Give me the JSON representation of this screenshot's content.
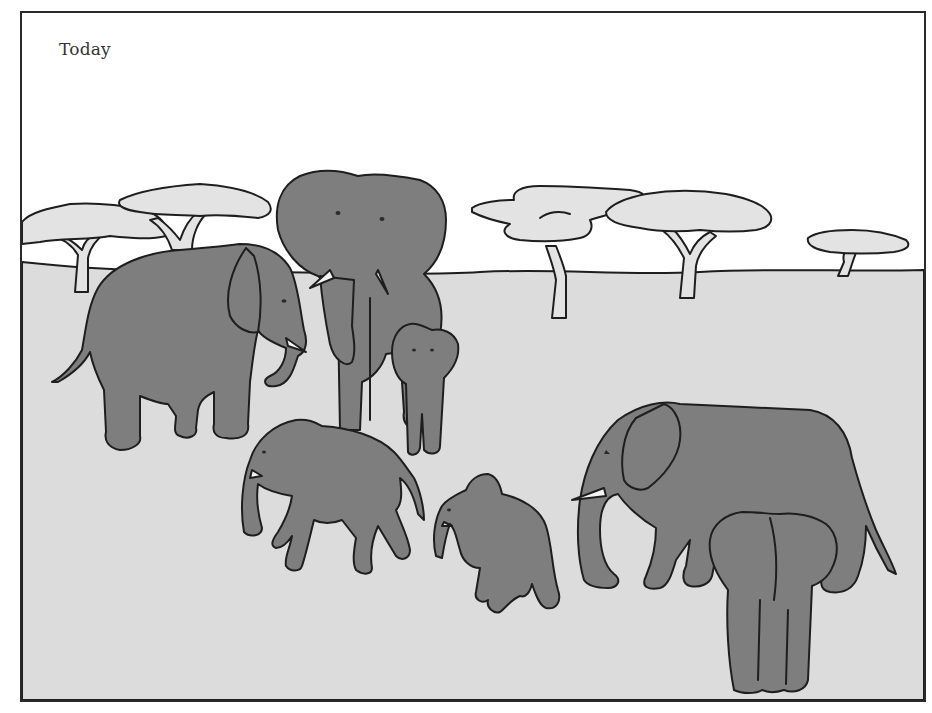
{
  "illustration": {
    "caption": "Today",
    "description": "Line illustration of an African savanna with a herd of elephants in the foreground and flat-topped acacia trees along the horizon",
    "colors": {
      "sky": "#ffffff",
      "ground": "#dcdcdc",
      "elephant_fill": "#7e7e7e",
      "foliage": "#e3e3e3",
      "tusk": "#f4f4f4",
      "outline": "#1e1e1e",
      "frame": "#2a2a2a"
    },
    "trees": [
      {
        "id": "tree-left-1",
        "position": "far left"
      },
      {
        "id": "tree-left-2",
        "position": "left, behind central bull"
      },
      {
        "id": "tree-center-1",
        "position": "center"
      },
      {
        "id": "tree-center-2",
        "position": "center right"
      },
      {
        "id": "tree-right",
        "position": "far right, distant"
      }
    ],
    "elephants": [
      {
        "id": "adult-left",
        "description": "adult facing right with tusks"
      },
      {
        "id": "bull-center",
        "description": "large adult facing viewer with tusks and spread ears"
      },
      {
        "id": "calf-center",
        "description": "calf facing viewer beside bull"
      },
      {
        "id": "juvenile-walking",
        "description": "young elephant walking left"
      },
      {
        "id": "calf-small",
        "description": "small calf walking left"
      },
      {
        "id": "adult-right",
        "description": "adult facing left with tusk"
      },
      {
        "id": "calf-rear",
        "description": "calf seen from behind"
      }
    ],
    "elephant_count": 7
  }
}
